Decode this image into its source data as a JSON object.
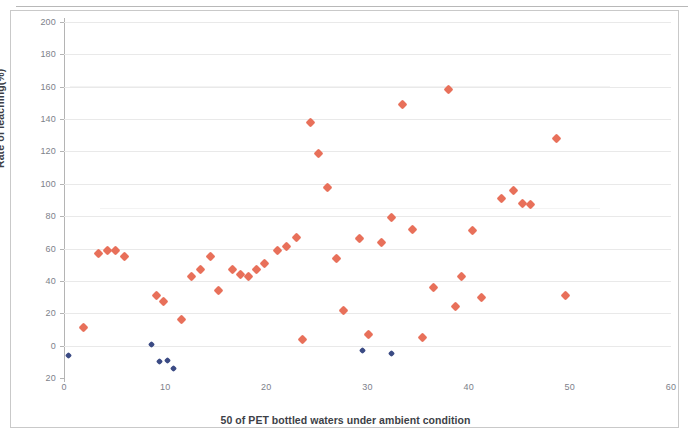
{
  "chart_data": {
    "type": "scatter",
    "title": "",
    "xlabel": "50 of PET bottled waters under ambient condition",
    "ylabel": "Rate of leaching(%)",
    "xlim": [
      0,
      60
    ],
    "ylim": [
      -20,
      200
    ],
    "xticks": [
      "0",
      "10",
      "20",
      "30",
      "40",
      "50",
      "60"
    ],
    "xtick_values": [
      0,
      10,
      20,
      30,
      40,
      50,
      60
    ],
    "yticks": [
      "200",
      "180",
      "160",
      "140",
      "120",
      "100",
      "80",
      "60",
      "40",
      "20",
      "0",
      "20"
    ],
    "ytick_values": [
      200,
      180,
      160,
      140,
      120,
      100,
      80,
      60,
      40,
      20,
      0,
      -20
    ],
    "grid": true,
    "grid_axis": "y",
    "legend": "none",
    "colors": {
      "series_0": "#e8705a",
      "series_1": "#3b4b84",
      "gridline": "#e9e9e9",
      "axis": "#b4b4b4",
      "tick_text": "#6c6f7a",
      "title_text": "#3d3f47",
      "background": "#ffffff"
    },
    "series": [
      {
        "name": "series-1",
        "color": "#e8705a",
        "marker": "diamond",
        "points": [
          [
            1.9,
            11
          ],
          [
            3.4,
            57
          ],
          [
            4.3,
            59
          ],
          [
            5.1,
            59
          ],
          [
            6.0,
            55
          ],
          [
            9.1,
            31
          ],
          [
            9.8,
            27
          ],
          [
            11.6,
            16
          ],
          [
            12.6,
            43
          ],
          [
            13.5,
            47
          ],
          [
            14.5,
            55
          ],
          [
            15.3,
            34
          ],
          [
            16.7,
            47
          ],
          [
            17.4,
            44
          ],
          [
            18.2,
            43
          ],
          [
            19.0,
            47
          ],
          [
            19.8,
            51
          ],
          [
            21.1,
            59
          ],
          [
            22.0,
            61
          ],
          [
            23.0,
            67
          ],
          [
            23.6,
            4
          ],
          [
            24.4,
            138
          ],
          [
            25.2,
            119
          ],
          [
            26.0,
            98
          ],
          [
            26.9,
            54
          ],
          [
            27.6,
            22
          ],
          [
            29.2,
            66
          ],
          [
            30.1,
            7
          ],
          [
            31.4,
            64
          ],
          [
            32.4,
            79
          ],
          [
            33.5,
            149
          ],
          [
            34.4,
            72
          ],
          [
            35.4,
            5
          ],
          [
            36.5,
            36
          ],
          [
            38.0,
            158
          ],
          [
            38.7,
            24
          ],
          [
            39.3,
            43
          ],
          [
            40.4,
            71
          ],
          [
            41.3,
            30
          ],
          [
            43.2,
            91
          ],
          [
            44.4,
            96
          ],
          [
            45.3,
            88
          ],
          [
            46.1,
            87
          ],
          [
            48.7,
            128
          ],
          [
            49.6,
            31
          ]
        ]
      },
      {
        "name": "series-2",
        "color": "#3b4b84",
        "marker": "diamond",
        "points": [
          [
            0.4,
            -6
          ],
          [
            8.6,
            1
          ],
          [
            9.4,
            -10
          ],
          [
            10.2,
            -9
          ],
          [
            10.8,
            -14
          ],
          [
            29.5,
            -3
          ],
          [
            32.4,
            -5
          ]
        ]
      }
    ]
  }
}
